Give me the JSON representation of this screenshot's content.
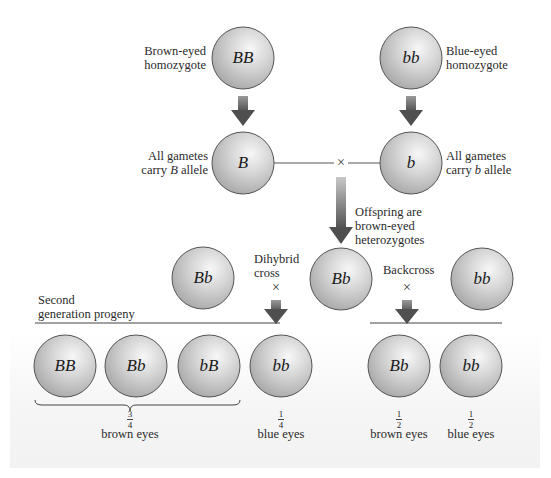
{
  "parents": {
    "brown": {
      "genotype": "BB",
      "label_line1": "Brown-eyed",
      "label_line2": "homozygote"
    },
    "blue": {
      "genotype": "bb",
      "label_line1": "Blue-eyed",
      "label_line2": "homozygote"
    }
  },
  "gametes": {
    "brown": {
      "allele": "B",
      "label_line1": "All gametes",
      "label_line2_pre": "carry ",
      "label_line2_allele": "B",
      "label_line2_post": " allele"
    },
    "blue": {
      "allele": "b",
      "label_line1": "All gametes",
      "label_line2_pre": "carry ",
      "label_line2_allele": "b",
      "label_line2_post": " allele"
    },
    "cross_symbol": "×"
  },
  "f1": {
    "label_line1": "Offspring are",
    "label_line2": "brown-eyed",
    "label_line3": "heterozygotes",
    "genotype": "Bb"
  },
  "dihybrid": {
    "label_line1": "Dihybrid",
    "label_line2": "cross",
    "cross_symbol": "×",
    "partner_genotype": "Bb"
  },
  "backcross": {
    "label": "Backcross",
    "cross_symbol": "×",
    "partner_genotype": "bb"
  },
  "second_generation": {
    "label_line1": "Second",
    "label_line2": "generation progeny"
  },
  "dihybrid_progeny": [
    {
      "genotype": "BB"
    },
    {
      "genotype": "Bb"
    },
    {
      "genotype": "bB"
    },
    {
      "genotype": "bb"
    }
  ],
  "dihybrid_outcomes": {
    "brown": {
      "numerator": "3",
      "denominator": "4",
      "label": "brown eyes"
    },
    "blue": {
      "numerator": "1",
      "denominator": "4",
      "label": "blue eyes"
    }
  },
  "backcross_progeny": [
    {
      "genotype": "Bb",
      "numerator": "1",
      "denominator": "2",
      "label": "brown eyes"
    },
    {
      "genotype": "bb",
      "numerator": "1",
      "denominator": "2",
      "label": "blue eyes"
    }
  ],
  "colors": {
    "sphere_light": "#f4f4f4",
    "sphere_mid": "#cfcfcf",
    "sphere_dark": "#a9a9a9",
    "outline": "#555555",
    "arrow_dark": "#5a5a5a",
    "arrow_light": "#bdbdbd",
    "line": "#444444"
  }
}
